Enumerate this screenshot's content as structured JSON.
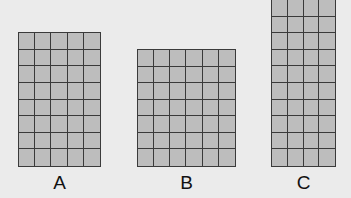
{
  "colors": {
    "background": "#ebebeb",
    "cell_fill": "#bdbdbd",
    "grid_line": "#3a3a3a"
  },
  "grids": [
    {
      "label": "A",
      "columns": 5,
      "rows": 8,
      "x": 18,
      "y": 32,
      "width": 83,
      "height": 135
    },
    {
      "label": "B",
      "columns": 6,
      "rows": 7,
      "x": 137,
      "y": 49,
      "width": 99,
      "height": 118
    },
    {
      "label": "C",
      "columns": 4,
      "rows": 10,
      "x": 271,
      "y": -1,
      "width": 65,
      "height": 168
    }
  ]
}
